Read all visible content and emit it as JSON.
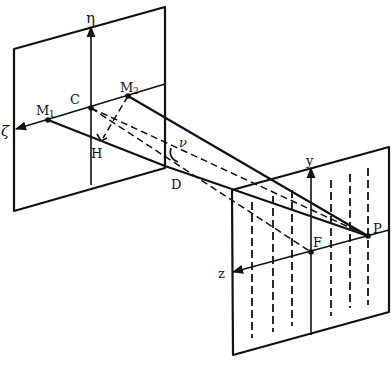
{
  "figure": {
    "width": 392,
    "height": 373,
    "background": "#ffffff",
    "ink": "#111111"
  },
  "object_plane": {
    "corners": [
      [
        14,
        49
      ],
      [
        165,
        7
      ],
      [
        165,
        168
      ],
      [
        14,
        211
      ]
    ],
    "eta_axis": {
      "from": [
        91,
        185
      ],
      "to": [
        91,
        27
      ],
      "label": "η",
      "label_pos": [
        87,
        22
      ]
    },
    "zeta_axis": {
      "from": [
        165,
        84
      ],
      "to": [
        16,
        129
      ],
      "label": "ζ",
      "label_pos": [
        2,
        135
      ]
    },
    "points": {
      "C": {
        "pos": [
          91,
          108
        ],
        "label": "C",
        "label_pos": [
          71,
          103
        ]
      },
      "M1": {
        "pos": [
          48,
          120
        ],
        "label": "M",
        "sub": "1",
        "label_pos": [
          37,
          113
        ]
      },
      "M2": {
        "pos": [
          128,
          96
        ],
        "label": "M",
        "sub": "2",
        "label_pos": [
          120,
          90
        ]
      },
      "H": {
        "pos": [
          103,
          138
        ],
        "label": "H",
        "label_pos": [
          91,
          156
        ]
      },
      "D": {
        "pos": [
          165,
          166
        ],
        "label": "D",
        "label_pos": [
          172,
          187
        ]
      }
    }
  },
  "image_plane": {
    "corners": [
      [
        232,
        190
      ],
      [
        389,
        147
      ],
      [
        389,
        312
      ],
      [
        233,
        355
      ]
    ],
    "y_axis": {
      "from": [
        311,
        335
      ],
      "to": [
        311,
        168
      ],
      "label": "y",
      "label_pos": [
        306,
        163
      ]
    },
    "z_axis": {
      "from": [
        389,
        230
      ],
      "to": [
        233,
        272
      ],
      "label": "z",
      "label_pos": [
        219,
        277
      ]
    },
    "points": {
      "F": {
        "pos": [
          311,
          252
        ],
        "label": "F",
        "label_pos": [
          312,
          245
        ]
      },
      "P": {
        "pos": [
          368,
          236
        ],
        "label": "P",
        "label_pos": [
          373,
          231
        ]
      }
    },
    "fringes": [
      {
        "x": 252,
        "y1": 202,
        "y2": 338
      },
      {
        "x": 273,
        "y1": 196,
        "y2": 332
      },
      {
        "x": 292,
        "y1": 190,
        "y2": 326
      },
      {
        "x": 331,
        "y1": 180,
        "y2": 316
      },
      {
        "x": 350,
        "y1": 174,
        "y2": 308
      },
      {
        "x": 368,
        "y1": 168,
        "y2": 305
      }
    ]
  },
  "rays": {
    "solid": [
      {
        "name": "ray-M1-D-P",
        "points": [
          [
            48,
            120
          ],
          [
            165,
            166
          ],
          [
            368,
            236
          ]
        ]
      },
      {
        "name": "ray-M2-P",
        "points": [
          [
            128,
            96
          ],
          [
            368,
            236
          ]
        ]
      }
    ],
    "dashed": [
      {
        "name": "ray-C-P",
        "points": [
          [
            91,
            108
          ],
          [
            368,
            236
          ]
        ]
      },
      {
        "name": "ray-C-F",
        "points": [
          [
            91,
            108
          ],
          [
            311,
            252
          ]
        ]
      },
      {
        "name": "perp-M2-H",
        "points": [
          [
            128,
            96
          ],
          [
            103,
            138
          ]
        ]
      }
    ]
  },
  "angle": {
    "label": "ν",
    "label_pos": [
      180,
      145
    ],
    "arc": "M171,148 Q168,158 178,162"
  },
  "labels": {
    "eta": "η",
    "zeta": "ζ",
    "C": "C",
    "M1": "M",
    "M1_sub": "1",
    "M2": "M",
    "M2_sub": "2",
    "H": "H",
    "D": "D",
    "nu": "ν",
    "y": "y",
    "z": "z",
    "F": "F",
    "P": "P"
  }
}
